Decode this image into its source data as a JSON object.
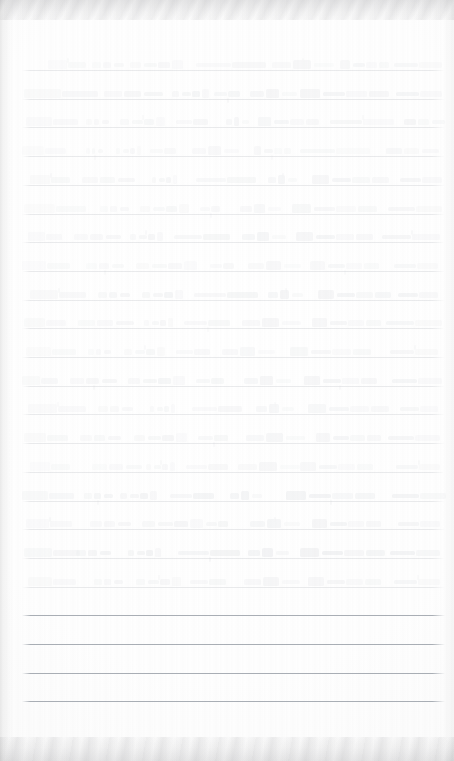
{
  "document": {
    "kind": "scanned-ruled-notebook-page",
    "description": "Heavily faded scan of a lined notebook page with handwriting",
    "legible_text": "",
    "width": 454,
    "height": 761,
    "background_color": "#fefefe"
  },
  "ruling": {
    "line_color": "#b9bcc2",
    "blank_line_color": "#9aa0a8",
    "left_x": 22,
    "right_x": 445,
    "first_line_y": 70,
    "spacing": 28.7,
    "line_count": 23,
    "blank_line_indices": [
      19,
      20,
      21,
      22
    ]
  },
  "handwriting": {
    "ink_color": "#cfd2d7",
    "faintest_ink_color": "#e6e8eb",
    "written_line_count": 19,
    "legibility": "illegible",
    "lines": [
      {
        "index": 0,
        "opacity": 0.16,
        "marks": [
          [
            48,
            38
          ],
          [
            92,
            30
          ],
          [
            130,
            52
          ],
          [
            196,
            70
          ],
          [
            272,
            60
          ],
          [
            340,
            46
          ],
          [
            394,
            48
          ]
        ]
      },
      {
        "index": 1,
        "opacity": 0.22,
        "marks": [
          [
            24,
            74
          ],
          [
            104,
            58
          ],
          [
            172,
            34
          ],
          [
            214,
            26
          ],
          [
            250,
            44
          ],
          [
            300,
            86
          ],
          [
            396,
            46
          ]
        ]
      },
      {
        "index": 2,
        "opacity": 0.18,
        "marks": [
          [
            26,
            52
          ],
          [
            86,
            20
          ],
          [
            120,
            44
          ],
          [
            176,
            32
          ],
          [
            226,
            20
          ],
          [
            258,
            58
          ],
          [
            330,
            64
          ],
          [
            404,
            40
          ]
        ]
      },
      {
        "index": 3,
        "opacity": 0.15,
        "marks": [
          [
            22,
            44
          ],
          [
            86,
            16
          ],
          [
            116,
            22
          ],
          [
            150,
            26
          ],
          [
            192,
            46
          ],
          [
            254,
            34
          ],
          [
            300,
            70
          ],
          [
            386,
            52
          ]
        ]
      },
      {
        "index": 4,
        "opacity": 0.2,
        "marks": [
          [
            30,
            40
          ],
          [
            82,
            52
          ],
          [
            152,
            24
          ],
          [
            196,
            60
          ],
          [
            268,
            28
          ],
          [
            312,
            76
          ],
          [
            400,
            42
          ]
        ]
      },
      {
        "index": 5,
        "opacity": 0.17,
        "marks": [
          [
            24,
            62
          ],
          [
            100,
            26
          ],
          [
            140,
            48
          ],
          [
            200,
            20
          ],
          [
            240,
            38
          ],
          [
            292,
            82
          ],
          [
            388,
            54
          ]
        ]
      },
      {
        "index": 6,
        "opacity": 0.21,
        "marks": [
          [
            28,
            34
          ],
          [
            74,
            44
          ],
          [
            130,
            30
          ],
          [
            174,
            56
          ],
          [
            242,
            42
          ],
          [
            296,
            74
          ],
          [
            382,
            58
          ]
        ]
      },
      {
        "index": 7,
        "opacity": 0.16,
        "marks": [
          [
            22,
            48
          ],
          [
            86,
            36
          ],
          [
            136,
            60
          ],
          [
            210,
            24
          ],
          [
            248,
            50
          ],
          [
            310,
            68
          ],
          [
            394,
            44
          ]
        ]
      },
      {
        "index": 8,
        "opacity": 0.23,
        "marks": [
          [
            30,
            56
          ],
          [
            98,
            30
          ],
          [
            142,
            38
          ],
          [
            194,
            64
          ],
          [
            268,
            34
          ],
          [
            318,
            72
          ],
          [
            398,
            40
          ]
        ]
      },
      {
        "index": 9,
        "opacity": 0.19,
        "marks": [
          [
            24,
            42
          ],
          [
            78,
            54
          ],
          [
            144,
            26
          ],
          [
            184,
            46
          ],
          [
            242,
            58
          ],
          [
            312,
            66
          ],
          [
            386,
            56
          ]
        ]
      },
      {
        "index": 10,
        "opacity": 0.17,
        "marks": [
          [
            26,
            50
          ],
          [
            88,
            22
          ],
          [
            124,
            40
          ],
          [
            176,
            34
          ],
          [
            222,
            52
          ],
          [
            290,
            78
          ],
          [
            390,
            48
          ]
        ]
      },
      {
        "index": 11,
        "opacity": 0.22,
        "marks": [
          [
            22,
            36
          ],
          [
            70,
            46
          ],
          [
            128,
            56
          ],
          [
            196,
            28
          ],
          [
            244,
            44
          ],
          [
            304,
            70
          ],
          [
            392,
            50
          ]
        ]
      },
      {
        "index": 12,
        "opacity": 0.18,
        "marks": [
          [
            28,
            58
          ],
          [
            98,
            32
          ],
          [
            150,
            24
          ],
          [
            192,
            50
          ],
          [
            256,
            36
          ],
          [
            308,
            80
          ],
          [
            400,
            38
          ]
        ]
      },
      {
        "index": 13,
        "opacity": 0.2,
        "marks": [
          [
            24,
            44
          ],
          [
            80,
            38
          ],
          [
            134,
            52
          ],
          [
            198,
            30
          ],
          [
            246,
            56
          ],
          [
            316,
            64
          ],
          [
            388,
            52
          ]
        ]
      },
      {
        "index": 14,
        "opacity": 0.16,
        "marks": [
          [
            30,
            40
          ],
          [
            92,
            48
          ],
          [
            146,
            28
          ],
          [
            186,
            42
          ],
          [
            238,
            60
          ],
          [
            300,
            72
          ],
          [
            396,
            44
          ]
        ]
      },
      {
        "index": 15,
        "opacity": 0.25,
        "marks": [
          [
            22,
            52
          ],
          [
            84,
            26
          ],
          [
            120,
            34
          ],
          [
            170,
            44
          ],
          [
            230,
            30
          ],
          [
            286,
            88
          ],
          [
            392,
            54
          ]
        ]
      },
      {
        "index": 16,
        "opacity": 0.21,
        "marks": [
          [
            26,
            46
          ],
          [
            90,
            40
          ],
          [
            142,
            58
          ],
          [
            206,
            22
          ],
          [
            250,
            48
          ],
          [
            312,
            68
          ],
          [
            398,
            42
          ]
        ]
      },
      {
        "index": 17,
        "opacity": 0.27,
        "marks": [
          [
            24,
            56
          ],
          [
            76,
            34
          ],
          [
            128,
            30
          ],
          [
            178,
            62
          ],
          [
            248,
            40
          ],
          [
            300,
            84
          ],
          [
            390,
            50
          ]
        ]
      },
      {
        "index": 18,
        "opacity": 0.19,
        "marks": [
          [
            28,
            48
          ],
          [
            94,
            26
          ],
          [
            136,
            44
          ],
          [
            190,
            36
          ],
          [
            244,
            54
          ],
          [
            308,
            70
          ],
          [
            394,
            46
          ]
        ]
      }
    ]
  }
}
